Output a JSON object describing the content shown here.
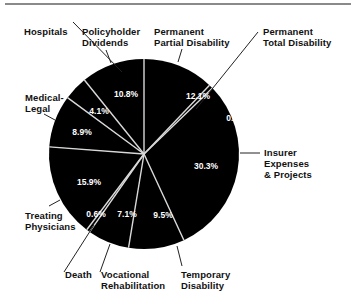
{
  "header": {
    "partial_title": ""
  },
  "chart_data": {
    "type": "pie",
    "title": "",
    "center": [
      144,
      154
    ],
    "radius": 95,
    "start_angle_deg": 0,
    "direction": "clockwise",
    "slice_color": "#000000",
    "divider_color": "#d9d9d9",
    "slices": [
      {
        "label": "Permanent Partial Disability",
        "value": 12.1,
        "pct_label": "12.1%"
      },
      {
        "label": "Permanent Total Disability",
        "value": 0.7,
        "pct_label": "0.7%"
      },
      {
        "label": "Insurer Expenses & Projects",
        "value": 30.3,
        "pct_label": "30.3%"
      },
      {
        "label": "Temporary Disability",
        "value": 9.5,
        "pct_label": "9.5%"
      },
      {
        "label": "Vocational Rehabilitation",
        "value": 7.1,
        "pct_label": "7.1%"
      },
      {
        "label": "Death",
        "value": 0.6,
        "pct_label": "0.6%"
      },
      {
        "label": "Treating Physicians",
        "value": 15.9,
        "pct_label": "15.9%"
      },
      {
        "label": "Medical-Legal",
        "value": 8.9,
        "pct_label": "8.9%"
      },
      {
        "label": "Hospitals",
        "value": 4.1,
        "pct_label": "4.1%"
      },
      {
        "label": "Policyholder Dividends",
        "value": 10.8,
        "pct_label": "10.8%"
      }
    ],
    "legend": "none (callout labels with leader lines)"
  },
  "labels": {
    "perm_partial": [
      "Permanent",
      "Partial Disability"
    ],
    "perm_total": [
      "Permanent",
      "Total Disability"
    ],
    "insurer": [
      "Insurer",
      "Expenses",
      "& Projects"
    ],
    "temporary": [
      "Temporary",
      "Disability"
    ],
    "vocational": [
      "Vocational",
      "Rehabilitation"
    ],
    "death": [
      "Death"
    ],
    "treating": [
      "Treating",
      "Physicians"
    ],
    "medical_legal": [
      "Medical-",
      "Legal"
    ],
    "hospitals": [
      "Hospitals"
    ],
    "policyholder": [
      "Policyholder",
      "Dividends"
    ]
  },
  "pct_positions": [
    {
      "x": 198,
      "y": 96
    },
    {
      "x": 236,
      "y": 118
    },
    {
      "x": 206,
      "y": 166
    },
    {
      "x": 163,
      "y": 215
    },
    {
      "x": 127,
      "y": 214
    },
    {
      "x": 96,
      "y": 214
    },
    {
      "x": 89,
      "y": 182
    },
    {
      "x": 82,
      "y": 132
    },
    {
      "x": 99,
      "y": 111
    },
    {
      "x": 126,
      "y": 94
    }
  ]
}
